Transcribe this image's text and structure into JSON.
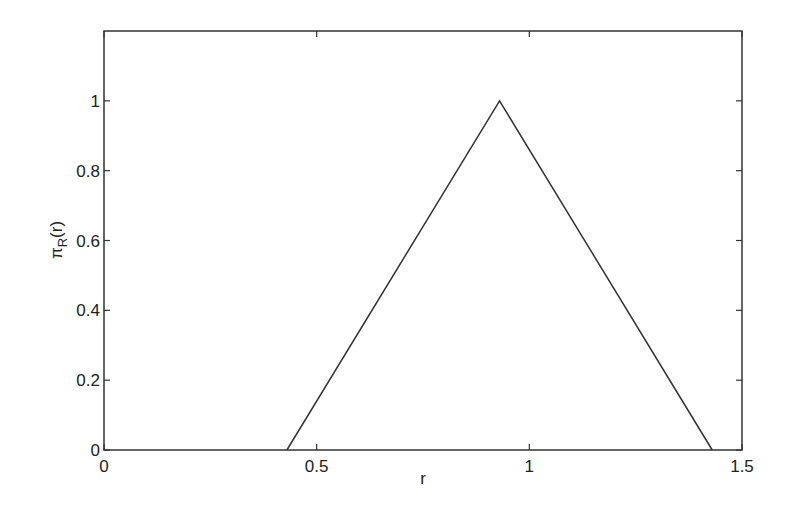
{
  "chart_data": {
    "type": "line",
    "title": "",
    "xlabel": "r",
    "ylabel": "π_R(r)",
    "ylabel_main": "π",
    "ylabel_sub": "R",
    "ylabel_arg": "(r)",
    "xlim": [
      0,
      1.5
    ],
    "ylim": [
      0,
      1.2
    ],
    "grid": false,
    "legend": null,
    "x_ticks": [
      0,
      0.5,
      1,
      1.5
    ],
    "x_tick_labels": [
      "0",
      "0.5",
      "1",
      "1.5"
    ],
    "y_ticks": [
      0,
      0.2,
      0.4,
      0.6,
      0.8,
      1
    ],
    "y_tick_labels": [
      "0",
      "0.2",
      "0.4",
      "0.6",
      "0.8",
      "1"
    ],
    "series": [
      {
        "name": "triangular membership function",
        "x": [
          0.43,
          0.93,
          1.43
        ],
        "y": [
          0,
          1,
          0
        ],
        "color": "#333333"
      }
    ]
  }
}
